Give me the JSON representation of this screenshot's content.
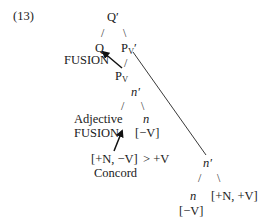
{
  "example_number": "(13)",
  "tree": {
    "root": {
      "label": "Q",
      "prime": "′"
    },
    "q": {
      "label": "Q",
      "annotation": "FUSION"
    },
    "pv_bar": {
      "label": "P",
      "sub": "V",
      "prime": "′"
    },
    "pv": {
      "label": "P",
      "sub": "V"
    },
    "n_bar_1": {
      "label": "n",
      "prime": "′"
    },
    "adjective": {
      "line1": "Adjective",
      "line2": "FUSION"
    },
    "n_1": {
      "label": "n",
      "feature": "[−V]"
    },
    "features_adj": {
      "label": "[+N, −V]",
      "result": "> +V",
      "annotation": "Concord"
    },
    "n_bar_2": {
      "label": "n",
      "prime": "′"
    },
    "n_2": {
      "label": "n",
      "feature": "[−V]"
    },
    "features_2": {
      "label": "[+N, +V]"
    },
    "branch_left": "/",
    "branch_right": "\\"
  },
  "arrows": [
    {
      "from": "P_V",
      "to": "Q",
      "label": "FUSION"
    },
    {
      "from": "[+N, −V]",
      "to": "Adjective",
      "label": "FUSION"
    }
  ],
  "colors": {
    "text": "#1a1a1a",
    "line": "#222222"
  }
}
